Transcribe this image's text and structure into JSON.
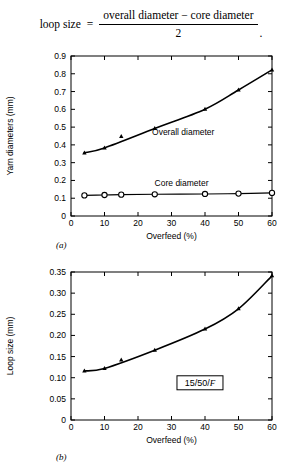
{
  "formula": {
    "lhs": "loop size",
    "equals": "=",
    "numerator": "overall diameter  −  core diameter",
    "denominator": "2",
    "trailing": "."
  },
  "panel_a_letter": "(a)",
  "panel_b_letter": "(b)",
  "box_annotation": {
    "prefix": "15/50/",
    "italic": "F"
  },
  "chart_data": [
    {
      "type": "line",
      "panel": "(a)",
      "title": "",
      "xlabel": "Overfeed (%)",
      "ylabel": "Yarn diameters (mm)",
      "xlim": [
        0,
        60
      ],
      "ylim": [
        0,
        0.9
      ],
      "xticks": [
        0,
        10,
        20,
        30,
        40,
        50,
        60
      ],
      "xticklabels": [
        "0",
        "10",
        "20",
        "30",
        "40",
        "50",
        "60"
      ],
      "yticks": [
        0,
        0.1,
        0.2,
        0.3,
        0.4,
        0.5,
        0.6,
        0.7,
        0.8,
        0.9
      ],
      "yticklabels": [
        "0",
        "0.1",
        "0.2",
        "0.3",
        "0.4",
        "0.5",
        "0.6",
        "0.7",
        "0.8",
        "0.9"
      ],
      "grid": false,
      "legend_position": "inline-annotation",
      "series": [
        {
          "name": "Overall diameter",
          "marker": "filled-triangle",
          "label_x": 33.5,
          "label_y": 0.455,
          "x": [
            4,
            10,
            15,
            25,
            40,
            50,
            60
          ],
          "y": [
            0.355,
            0.383,
            0.447,
            0.492,
            0.601,
            0.709,
            0.822
          ],
          "curve_x": [
            4,
            10,
            25,
            40,
            50,
            60
          ],
          "curve_y": [
            0.355,
            0.383,
            0.492,
            0.601,
            0.709,
            0.822
          ]
        },
        {
          "name": "Core diameter",
          "marker": "open-circle",
          "label_x": 33.0,
          "label_y": 0.171,
          "x": [
            4,
            10,
            15,
            25,
            40,
            50,
            60
          ],
          "y": [
            0.116,
            0.118,
            0.12,
            0.122,
            0.124,
            0.126,
            0.13
          ],
          "curve_x": [
            4,
            10,
            15,
            25,
            40,
            50,
            60
          ],
          "curve_y": [
            0.116,
            0.118,
            0.12,
            0.122,
            0.124,
            0.126,
            0.13
          ]
        }
      ]
    },
    {
      "type": "line",
      "panel": "(b)",
      "title": "",
      "xlabel": "Overfeed (%)",
      "ylabel": "Loop size (mm)",
      "xlim": [
        0,
        60
      ],
      "ylim": [
        0,
        0.35
      ],
      "xticks": [
        0,
        10,
        20,
        30,
        40,
        50,
        60
      ],
      "xticklabels": [
        "0",
        "10",
        "20",
        "30",
        "40",
        "50",
        "60"
      ],
      "yticks": [
        0,
        0.05,
        0.1,
        0.15,
        0.2,
        0.25,
        0.3,
        0.35
      ],
      "yticklabels": [
        "0",
        "0.05",
        "0.10",
        "0.15",
        "0.20",
        "0.25",
        "0.30",
        "0.35"
      ],
      "grid": false,
      "legend_position": "none",
      "series": [
        {
          "name": "Loop size",
          "marker": "filled-triangle",
          "x": [
            4,
            10,
            15,
            25,
            40,
            50,
            60
          ],
          "y": [
            0.116,
            0.122,
            0.142,
            0.165,
            0.215,
            0.263,
            0.341
          ],
          "curve_x": [
            4,
            10,
            25,
            40,
            50,
            60
          ],
          "curve_y": [
            0.116,
            0.122,
            0.165,
            0.215,
            0.263,
            0.341
          ]
        }
      ]
    }
  ]
}
